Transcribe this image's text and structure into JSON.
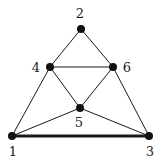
{
  "graph": {
    "nodes": [
      {
        "id": "1",
        "label": "1",
        "x": 12,
        "y": 136,
        "lx": 13,
        "ly": 156
      },
      {
        "id": "2",
        "label": "2",
        "x": 81,
        "y": 29,
        "lx": 80,
        "ly": 18
      },
      {
        "id": "3",
        "label": "3",
        "x": 149,
        "y": 136,
        "lx": 150,
        "ly": 156
      },
      {
        "id": "4",
        "label": "4",
        "x": 50,
        "y": 67,
        "lx": 36,
        "ly": 72
      },
      {
        "id": "5",
        "label": "5",
        "x": 80,
        "y": 108,
        "lx": 79,
        "ly": 127
      },
      {
        "id": "6",
        "label": "6",
        "x": 113,
        "y": 67,
        "lx": 127,
        "ly": 72
      }
    ],
    "edges": [
      {
        "from": "1",
        "to": "4",
        "width": 1
      },
      {
        "from": "4",
        "to": "2",
        "width": 1
      },
      {
        "from": "2",
        "to": "6",
        "width": 1
      },
      {
        "from": "6",
        "to": "3",
        "width": 1
      },
      {
        "from": "4",
        "to": "6",
        "width": 1
      },
      {
        "from": "4",
        "to": "5",
        "width": 1
      },
      {
        "from": "6",
        "to": "5",
        "width": 1
      },
      {
        "from": "1",
        "to": "5",
        "width": 1
      },
      {
        "from": "5",
        "to": "3",
        "width": 1
      },
      {
        "from": "1",
        "to": "3",
        "width": 3
      }
    ],
    "colors": {
      "edge": "#1a1a1a",
      "node": "#111111"
    }
  }
}
